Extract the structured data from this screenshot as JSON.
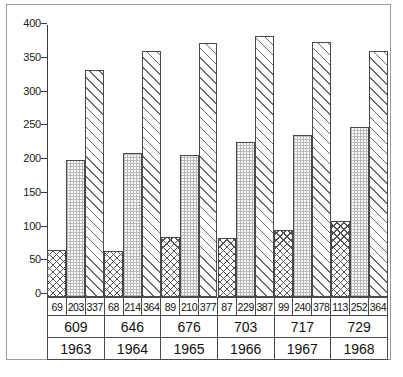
{
  "chart_data": {
    "type": "bar",
    "title": "",
    "xlabel": "",
    "ylabel": "",
    "ylim": [
      0,
      400
    ],
    "yticks": [
      0,
      50,
      100,
      150,
      200,
      250,
      300,
      350,
      400
    ],
    "grid": false,
    "legend": "none",
    "categories": [
      "1963",
      "1964",
      "1965",
      "1966",
      "1967",
      "1968"
    ],
    "series": [
      {
        "name": "series-1",
        "pattern": "cross-hatch",
        "values": [
          69,
          68,
          89,
          87,
          99,
          113
        ]
      },
      {
        "name": "series-2",
        "pattern": "fine-dotted",
        "values": [
          203,
          214,
          210,
          229,
          240,
          252
        ]
      },
      {
        "name": "series-3",
        "pattern": "diagonal-stripe",
        "values": [
          337,
          364,
          377,
          387,
          378,
          364
        ]
      }
    ],
    "totals": [
      609,
      646,
      676,
      703,
      717,
      729
    ]
  },
  "table": {
    "value_rows": [
      [
        "69",
        "203",
        "337"
      ],
      [
        "68",
        "214",
        "364"
      ],
      [
        "89",
        "210",
        "377"
      ],
      [
        "87",
        "229",
        "387"
      ],
      [
        "99",
        "240",
        "378"
      ],
      [
        "113",
        "252",
        "364"
      ]
    ],
    "totals": [
      "609",
      "646",
      "676",
      "703",
      "717",
      "729"
    ],
    "years": [
      "1963",
      "1964",
      "1965",
      "1966",
      "1967",
      "1968"
    ]
  },
  "axis": {
    "labels": [
      "400",
      "350",
      "300",
      "250",
      "200",
      "150",
      "100",
      "50",
      "0"
    ]
  },
  "colors": {
    "ink": "#1a1a1a",
    "line": "#4a4a4a",
    "frame": "#9a9a9a",
    "paper": "#ffffff"
  }
}
